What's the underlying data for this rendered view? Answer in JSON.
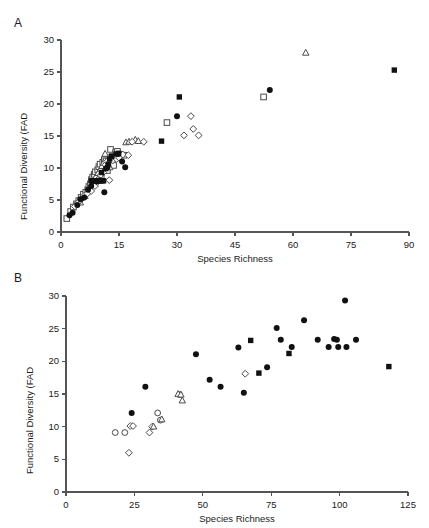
{
  "figure": {
    "background": "#ffffff",
    "marker_color_filled": "#111111",
    "marker_color_open_stroke": "#4a4a4a",
    "axis_color": "#555555"
  },
  "panels": [
    {
      "id": "A",
      "label": "A",
      "chart_data": {
        "type": "scatter",
        "title": "",
        "xlabel": "Species Richness",
        "ylabel": "Functional Diversity (FAD",
        "xlim": [
          0,
          90
        ],
        "ylim": [
          0,
          30
        ],
        "xticks": [
          0,
          15,
          30,
          45,
          60,
          75,
          90
        ],
        "yticks": [
          0,
          5,
          10,
          15,
          20,
          25,
          30
        ],
        "xticklabels": [
          "0",
          "15",
          "30",
          "45",
          "60",
          "75",
          "90"
        ],
        "yticklabels": [
          "0",
          "5",
          "10",
          "15",
          "20",
          "25",
          "30"
        ],
        "grid": false,
        "legend": "none",
        "series": [
          {
            "name": "open-square",
            "marker": "square",
            "fill": "open",
            "points": [
              [
                1.5,
                2.1
              ],
              [
                2.5,
                3.2
              ],
              [
                3.2,
                3.9
              ],
              [
                4.0,
                4.4
              ],
              [
                4.6,
                4.9
              ],
              [
                5.2,
                5.4
              ],
              [
                5.8,
                5.9
              ],
              [
                6.4,
                6.2
              ],
              [
                6.9,
                6.6
              ],
              [
                7.2,
                7.1
              ],
              [
                7.6,
                7.5
              ],
              [
                7.9,
                8.2
              ],
              [
                8.2,
                8.6
              ],
              [
                8.6,
                9.0
              ],
              [
                8.9,
                9.4
              ],
              [
                9.2,
                8.1
              ],
              [
                9.5,
                9.7
              ],
              [
                9.8,
                10.2
              ],
              [
                10.1,
                10.6
              ],
              [
                10.4,
                8.5
              ],
              [
                10.8,
                10.9
              ],
              [
                11.2,
                11.3
              ],
              [
                11.6,
                11.1
              ],
              [
                12.0,
                9.6
              ],
              [
                12.4,
                11.6
              ],
              [
                12.8,
                12.9
              ],
              [
                13.2,
                11.8
              ],
              [
                13.6,
                10.4
              ],
              [
                14.1,
                12.4
              ],
              [
                14.6,
                12.6
              ],
              [
                15.2,
                12.1
              ],
              [
                16.2,
                12.0
              ],
              [
                27.4,
                17.1
              ],
              [
                52.4,
                21.1
              ]
            ]
          },
          {
            "name": "open-triangle",
            "marker": "triangle",
            "fill": "open",
            "points": [
              [
                5.0,
                4.6
              ],
              [
                6.2,
                5.6
              ],
              [
                7.4,
                6.9
              ],
              [
                8.4,
                7.9
              ],
              [
                9.0,
                8.6
              ],
              [
                9.6,
                9.2
              ],
              [
                10.2,
                9.8
              ],
              [
                10.6,
                10.3
              ],
              [
                11.0,
                10.8
              ],
              [
                11.4,
                12.2
              ],
              [
                11.8,
                11.0
              ],
              [
                12.2,
                11.2
              ],
              [
                12.6,
                10.1
              ],
              [
                13.1,
                11.5
              ],
              [
                14.0,
                11.9
              ],
              [
                16.8,
                14.0
              ],
              [
                17.6,
                14.1
              ],
              [
                19.2,
                14.4
              ],
              [
                20.0,
                14.2
              ],
              [
                63.3,
                28.0
              ]
            ]
          },
          {
            "name": "open-diamond",
            "marker": "diamond",
            "fill": "open",
            "points": [
              [
                3.6,
                4.0
              ],
              [
                4.4,
                4.6
              ],
              [
                5.4,
                5.2
              ],
              [
                6.0,
                5.7
              ],
              [
                6.8,
                6.0
              ],
              [
                7.8,
                6.4
              ],
              [
                8.8,
                7.2
              ],
              [
                9.4,
                7.8
              ],
              [
                9.9,
                8.4
              ],
              [
                10.3,
                8.9
              ],
              [
                10.9,
                9.3
              ],
              [
                11.5,
                10.5
              ],
              [
                11.9,
                11.0
              ],
              [
                12.5,
                8.1
              ],
              [
                13.4,
                11.2
              ],
              [
                14.4,
                11.4
              ],
              [
                15.0,
                11.6
              ],
              [
                16.0,
                12.1
              ],
              [
                17.4,
                12.0
              ],
              [
                18.4,
                14.1
              ],
              [
                21.4,
                14.1
              ],
              [
                31.8,
                15.1
              ],
              [
                33.6,
                18.1
              ],
              [
                34.2,
                16.1
              ],
              [
                35.6,
                15.1
              ]
            ]
          },
          {
            "name": "filled-square",
            "marker": "square",
            "fill": "filled",
            "points": [
              [
                7.8,
                8.0
              ],
              [
                8.2,
                8.0
              ],
              [
                8.6,
                8.0
              ],
              [
                9.0,
                8.0
              ],
              [
                9.4,
                8.0
              ],
              [
                9.8,
                8.0
              ],
              [
                10.2,
                8.0
              ],
              [
                10.6,
                8.0
              ],
              [
                11.0,
                8.0
              ],
              [
                10.5,
                9.3
              ],
              [
                11.6,
                9.9
              ],
              [
                12.2,
                10.6
              ],
              [
                12.6,
                11.4
              ],
              [
                13.1,
                11.8
              ],
              [
                14.2,
                12.2
              ],
              [
                14.9,
                12.3
              ],
              [
                26.0,
                14.2
              ],
              [
                30.6,
                21.1
              ],
              [
                86.2,
                25.3
              ]
            ]
          },
          {
            "name": "filled-circle",
            "marker": "circle",
            "fill": "filled",
            "points": [
              [
                2.2,
                2.6
              ],
              [
                3.0,
                3.0
              ],
              [
                4.2,
                4.2
              ],
              [
                5.0,
                5.1
              ],
              [
                6.0,
                5.4
              ],
              [
                7.0,
                6.6
              ],
              [
                7.8,
                7.2
              ],
              [
                9.2,
                7.9
              ],
              [
                10.0,
                8.1
              ],
              [
                11.2,
                6.2
              ],
              [
                12.0,
                10.1
              ],
              [
                14.8,
                12.2
              ],
              [
                15.8,
                11.0
              ],
              [
                16.6,
                10.1
              ],
              [
                30.0,
                18.1
              ],
              [
                54.0,
                22.2
              ]
            ]
          }
        ]
      }
    },
    {
      "id": "B",
      "label": "B",
      "chart_data": {
        "type": "scatter",
        "title": "",
        "xlabel": "Species Richness",
        "ylabel": "Functional Diversity (FAD",
        "xlim": [
          0,
          125
        ],
        "ylim": [
          0,
          30
        ],
        "xticks": [
          0,
          25,
          50,
          75,
          100,
          125
        ],
        "yticks": [
          0,
          5,
          10,
          15,
          20,
          25,
          30
        ],
        "xticklabels": [
          "0",
          "25",
          "50",
          "75",
          "100",
          "125"
        ],
        "yticklabels": [
          "0",
          "5",
          "10",
          "15",
          "20",
          "25",
          "30"
        ],
        "grid": false,
        "legend": "none",
        "series": [
          {
            "name": "open-circle",
            "marker": "circle",
            "fill": "open",
            "points": [
              [
                18.0,
                9.1
              ],
              [
                21.5,
                9.1
              ],
              [
                33.5,
                12.1
              ],
              [
                34.5,
                11.0
              ],
              [
                41.5,
                14.9
              ]
            ]
          },
          {
            "name": "open-diamond",
            "marker": "diamond",
            "fill": "open",
            "points": [
              [
                23.5,
                10.1
              ],
              [
                24.5,
                10.1
              ],
              [
                23.0,
                6.0
              ],
              [
                30.5,
                9.1
              ],
              [
                31.5,
                10.0
              ],
              [
                65.5,
                18.1
              ]
            ]
          },
          {
            "name": "open-triangle",
            "marker": "triangle",
            "fill": "open",
            "points": [
              [
                32.0,
                10.0
              ],
              [
                35.0,
                11.1
              ],
              [
                41.0,
                15.0
              ],
              [
                42.0,
                14.9
              ],
              [
                42.5,
                14.0
              ]
            ]
          },
          {
            "name": "filled-circle",
            "marker": "circle",
            "fill": "filled",
            "points": [
              [
                24.0,
                12.1
              ],
              [
                29.0,
                16.1
              ],
              [
                47.5,
                21.1
              ],
              [
                52.5,
                17.2
              ],
              [
                56.5,
                16.1
              ],
              [
                63.0,
                22.1
              ],
              [
                65.0,
                15.2
              ],
              [
                73.5,
                19.1
              ],
              [
                77.0,
                25.1
              ],
              [
                78.5,
                23.3
              ],
              [
                82.5,
                22.2
              ],
              [
                87.0,
                26.3
              ],
              [
                92.0,
                23.3
              ],
              [
                96.0,
                22.2
              ],
              [
                98.0,
                23.4
              ],
              [
                99.0,
                23.3
              ],
              [
                99.5,
                22.2
              ],
              [
                102.0,
                29.3
              ],
              [
                102.5,
                22.2
              ],
              [
                106.0,
                23.3
              ]
            ]
          },
          {
            "name": "filled-square",
            "marker": "square",
            "fill": "filled",
            "points": [
              [
                67.5,
                23.2
              ],
              [
                70.5,
                18.2
              ],
              [
                81.5,
                21.2
              ],
              [
                118.0,
                19.2
              ]
            ]
          }
        ]
      }
    }
  ]
}
